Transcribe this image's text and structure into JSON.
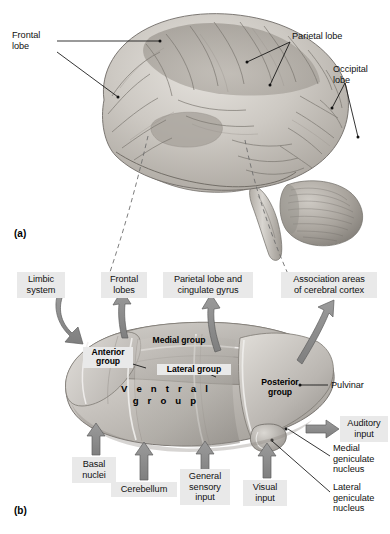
{
  "figure": {
    "title_internal": "Thalamus and cerebral lobes",
    "panels": [
      {
        "tag": "(a)",
        "name": "lateral-view-of-brain"
      },
      {
        "tag": "(b)",
        "name": "thalamic-nuclei-diagram"
      }
    ],
    "colors": {
      "background": "#ffffff",
      "label_box": "#e9e9e9",
      "arrow_fill": "#8b8b8b",
      "arrow_stroke": "#5e5e5e",
      "leader_line": "#111111",
      "dashed_line": "#6e6e6e",
      "brain_light": "#d9d6d1",
      "brain_mid": "#b9b5ae",
      "brain_dark": "#8e8a84",
      "thalamus_light": "#d7d5d1",
      "thalamus_mid": "#b5b2ad",
      "thalamus_dark": "#98948f"
    }
  },
  "panel_a": {
    "tag": "(a)",
    "labels": [
      {
        "id": "frontal-lobe",
        "text": "Frontal\nlobe"
      },
      {
        "id": "parietal-lobe",
        "text": "Parietal lobe"
      },
      {
        "id": "occipital-lobe",
        "text": "Occipital\nlobe"
      }
    ]
  },
  "panel_b": {
    "tag": "(b)",
    "output_targets": [
      {
        "id": "limbic-system",
        "text": "Limbic\nsystem"
      },
      {
        "id": "frontal-lobes",
        "text": "Frontal\nlobes"
      },
      {
        "id": "parietal-lobe-and-cingulate-gyrus",
        "text": "Parietal lobe and\ncingulate gyrus"
      },
      {
        "id": "association-areas-of-cerebral-cortex",
        "text": "Association areas\nof cerebral cortex"
      }
    ],
    "input_sources": [
      {
        "id": "basal-nuclei",
        "text": "Basal\nnuclei"
      },
      {
        "id": "cerebellum",
        "text": "Cerebellum"
      },
      {
        "id": "general-sensory-input",
        "text": "General\nsensory\ninput"
      },
      {
        "id": "visual-input",
        "text": "Visual\ninput"
      },
      {
        "id": "auditory-input",
        "text": "Auditory\ninput"
      }
    ],
    "nuclei_groups": [
      {
        "id": "anterior-group",
        "text": "Anterior\ngroup"
      },
      {
        "id": "medial-group",
        "text": "Medial group"
      },
      {
        "id": "lateral-group",
        "text": "Lateral group"
      },
      {
        "id": "ventral-group",
        "text": "V e n t r a l\ng r o u p"
      },
      {
        "id": "posterior-group",
        "text": "Posterior\ngroup"
      }
    ],
    "leader_labels": [
      {
        "id": "pulvinar",
        "text": "Pulvinar"
      },
      {
        "id": "medial-geniculate-nucleus",
        "text": "Medial\ngeniculate\nnucleus"
      },
      {
        "id": "lateral-geniculate-nucleus",
        "text": "Lateral\ngeniculate\nnucleus"
      }
    ]
  }
}
